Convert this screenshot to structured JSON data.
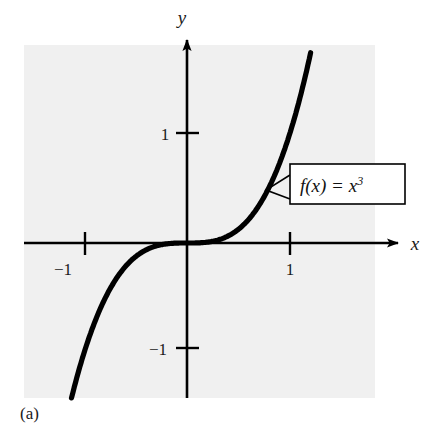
{
  "figure": {
    "caption": "(a)",
    "background_color": "#ffffff",
    "panel_color": "#f0f0f0",
    "ink_color": "#000000"
  },
  "chart_data": {
    "type": "line",
    "title": "",
    "subtitle": "",
    "xlabel": "x",
    "ylabel": "y",
    "function_label": "f(x)  =  x",
    "function_exponent": "3",
    "expression": "f(x) = x^3",
    "xlim": [
      -1.58,
      1.83
    ],
    "ylim": [
      -1.42,
      1.78
    ],
    "xticks": [
      -1,
      1
    ],
    "xtick_labels": [
      "−1",
      "1"
    ],
    "yticks": [
      -1,
      1
    ],
    "ytick_labels": [
      "−1",
      "1"
    ],
    "grid": false,
    "legend": "none",
    "annotations": [
      {
        "name": "function-callout",
        "text": "f(x)  =  x",
        "superscript": "3",
        "points_to_x": 0.76,
        "points_to_y": 0.44
      }
    ],
    "x": [
      -1.58,
      -1.5,
      -1.4,
      -1.3,
      -1.2,
      -1.1,
      -1.0,
      -0.9,
      -0.8,
      -0.7,
      -0.6,
      -0.5,
      -0.4,
      -0.3,
      -0.2,
      -0.1,
      0.0,
      0.1,
      0.2,
      0.3,
      0.4,
      0.5,
      0.6,
      0.7,
      0.8,
      0.9,
      1.0,
      1.1,
      1.2,
      1.22
    ],
    "y": [
      -3.94,
      -3.375,
      -2.744,
      -2.197,
      -1.728,
      -1.331,
      -1.0,
      -0.729,
      -0.512,
      -0.343,
      -0.216,
      -0.125,
      -0.064,
      -0.027,
      -0.008,
      -0.001,
      0.0,
      0.001,
      0.008,
      0.027,
      0.064,
      0.125,
      0.216,
      0.343,
      0.512,
      0.729,
      1.0,
      1.331,
      1.728,
      1.816
    ]
  },
  "axes": {
    "x_axis_name": "x-axis",
    "y_axis_name": "y-axis",
    "origin_label": ""
  }
}
